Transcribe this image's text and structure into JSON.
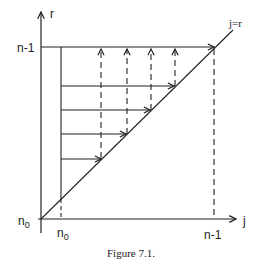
{
  "figure": {
    "caption": "Figure 7.1.",
    "colors": {
      "line": "#222222",
      "background": "#ffffff"
    },
    "axes": {
      "y_label": "r",
      "x_label": "j",
      "y_ticks": [
        "n-1",
        "n0"
      ],
      "x_ticks": [
        "n0",
        "n-1"
      ],
      "y_tick_top": "n-1",
      "y_tick_bottom_base": "n",
      "y_tick_bottom_sub": "0",
      "x_tick_left_base": "n",
      "x_tick_left_sub": "0",
      "x_tick_right": "n-1"
    },
    "diagonal_label": "j=r",
    "horizontal_arrow_count": 5,
    "vertical_dashed_arrow_count": 4
  }
}
